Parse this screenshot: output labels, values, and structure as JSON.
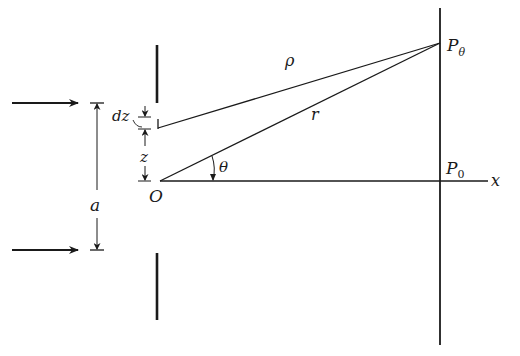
{
  "figure": {
    "type": "single-slit diffraction geometry",
    "labels": {
      "slit_width": "a",
      "element": "dz",
      "height": "z",
      "origin": "O",
      "angle": "θ",
      "path_rho": "ρ",
      "path_r": "r",
      "point_theta": "P",
      "point_theta_sub": "θ",
      "point_zero": "P",
      "point_zero_sub": "0",
      "axis": "x"
    },
    "colors": {
      "ink": "#1a1a1a",
      "background": "#ffffff"
    },
    "incident_arrows": 2
  }
}
